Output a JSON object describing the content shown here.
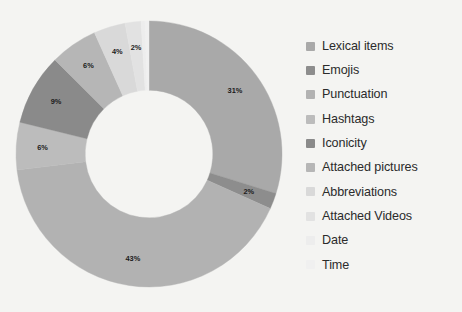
{
  "chart_data": {
    "type": "pie",
    "variant": "donut",
    "title": "",
    "xlabel": "",
    "ylabel": "",
    "legend_position": "right",
    "grid": false,
    "value_suffix": "%",
    "start_angle_deg": 0,
    "direction": "clockwise",
    "inner_radius_ratio": 0.48,
    "categories": [
      "Lexical items",
      "Emojis",
      "Punctuation",
      "Hashtags",
      "Iconicity",
      "Attached pictures",
      "Abbreviations",
      "Attached Videos",
      "Date",
      "Time"
    ],
    "values": [
      31,
      2,
      43,
      6,
      9,
      6,
      4,
      2,
      0.5,
      0.5
    ],
    "data_labels": [
      "31%",
      "2%",
      "43%",
      "6%",
      "9%",
      "6%",
      "4%",
      "2%",
      "",
      ""
    ],
    "colors": [
      "#a9a9a9",
      "#8d8d8d",
      "#b2b2b2",
      "#bcbcbc",
      "#8a8a8a",
      "#b6b6b6",
      "#d9d9d9",
      "#e2e2e2",
      "#ededed",
      "#f0f0f0"
    ]
  },
  "legend": {
    "items": [
      {
        "label": "Lexical items",
        "color": "#a9a9a9"
      },
      {
        "label": "Emojis",
        "color": "#8d8d8d"
      },
      {
        "label": "Punctuation",
        "color": "#b2b2b2"
      },
      {
        "label": "Hashtags",
        "color": "#bcbcbc"
      },
      {
        "label": "Iconicity",
        "color": "#8a8a8a"
      },
      {
        "label": "Attached pictures",
        "color": "#b6b6b6"
      },
      {
        "label": "Abbreviations",
        "color": "#d9d9d9"
      },
      {
        "label": "Attached Videos",
        "color": "#e2e2e2"
      },
      {
        "label": "Date",
        "color": "#ededed"
      },
      {
        "label": "Time",
        "color": "#f0f0f0"
      }
    ]
  },
  "canvas": {
    "background": "#f4f4f2"
  }
}
